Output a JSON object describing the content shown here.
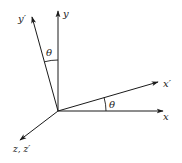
{
  "diagram": {
    "origin": [
      58,
      111
    ],
    "axes": [
      {
        "id": "x",
        "label": "x",
        "tip": [
          163,
          111
        ],
        "label_pos": [
          163,
          120
        ]
      },
      {
        "id": "y",
        "label": "y",
        "tip": [
          58,
          11
        ],
        "label_pos": [
          63,
          17
        ]
      },
      {
        "id": "xp",
        "label": "x′",
        "tip": [
          158,
          82
        ],
        "label_pos": [
          163,
          87
        ]
      },
      {
        "id": "yp",
        "label": "y′",
        "tip": [
          32,
          17
        ],
        "label_pos": [
          18,
          22
        ]
      },
      {
        "id": "z",
        "label": "z, z′",
        "tip": [
          20,
          140
        ],
        "label_pos": [
          13,
          152
        ]
      }
    ],
    "angles": [
      {
        "id": "theta-upper",
        "label": "θ",
        "between": [
          "y",
          "y′"
        ],
        "label_pos": [
          46,
          56
        ]
      },
      {
        "id": "theta-lower",
        "label": "θ",
        "between": [
          "x",
          "x′"
        ],
        "label_pos": [
          109,
          108
        ]
      }
    ],
    "colors": {
      "stroke": "#1a1a1a",
      "background": "#ffffff"
    }
  }
}
